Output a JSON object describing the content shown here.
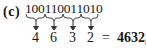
{
  "problem": {
    "label": "(c)",
    "binary": "100110011010",
    "groups": [
      "100",
      "110",
      "011",
      "010"
    ],
    "octal_digits": [
      "4",
      "6",
      "3",
      "2"
    ],
    "equals": "=",
    "result": "4632",
    "base_subscript": "8"
  }
}
